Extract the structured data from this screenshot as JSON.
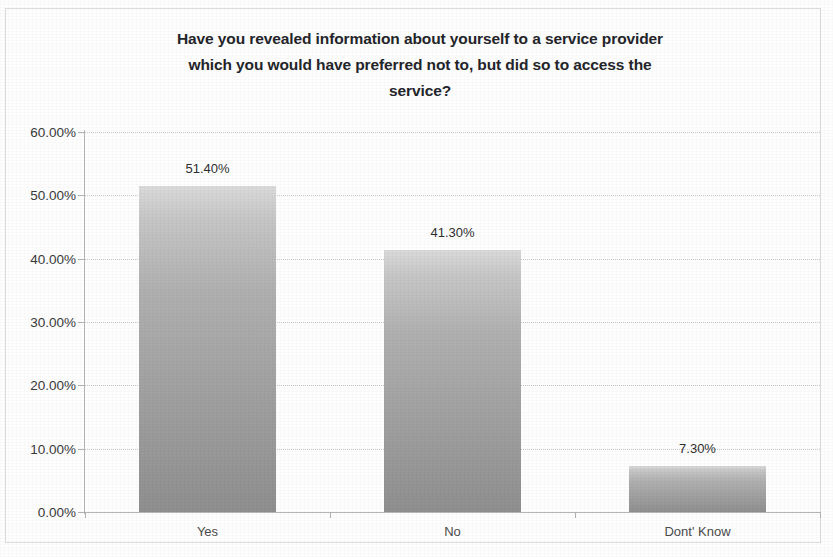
{
  "chart_data": {
    "type": "bar",
    "title": "Have you revealed information about yourself to a service provider which you would have preferred not to, but did so to access the service?",
    "title_lines": [
      "Have you revealed information about yourself to a service provider",
      "which you would have preferred not to, but did so to access the",
      "service?"
    ],
    "categories": [
      "Yes",
      "No",
      "Dont' Know"
    ],
    "values": [
      51.4,
      41.3,
      7.3
    ],
    "data_labels": [
      "51.40%",
      "41.30%",
      "7.30%"
    ],
    "xlabel": "",
    "ylabel": "",
    "ylim": [
      0,
      60
    ],
    "ytick_values": [
      0,
      10,
      20,
      30,
      40,
      50,
      60
    ],
    "ytick_labels": [
      "0.00%",
      "10.00%",
      "20.00%",
      "30.00%",
      "40.00%",
      "50.00%",
      "60.00%"
    ],
    "grid": true,
    "legend": false,
    "series": [
      {
        "name": "Response",
        "values": [
          51.4,
          41.3,
          7.3
        ]
      }
    ],
    "colors": {
      "bar_fill_top": "#dadada",
      "bar_fill_mid": "#a5a5a5",
      "bar_fill_bottom": "#8f8f8f",
      "gridline": "#c9c9c9",
      "axis": "#b4b4b4",
      "title_text": "#24252a",
      "tick_text": "#3a3a3a",
      "plot_background": "#ffffff"
    }
  }
}
